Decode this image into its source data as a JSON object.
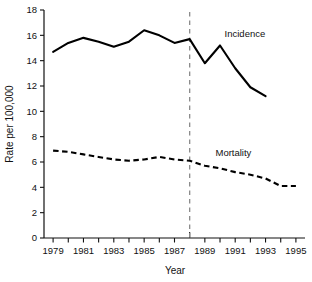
{
  "chart_data": {
    "type": "line",
    "title": "",
    "xlabel": "Year",
    "ylabel": "Rate per 100,000",
    "xlim": [
      1978.4,
      1995.6
    ],
    "ylim": [
      0,
      18
    ],
    "yticks": [
      0,
      2,
      4,
      6,
      8,
      10,
      12,
      14,
      16,
      18
    ],
    "ytick_labels": [
      "0",
      "2",
      "4",
      "6",
      "8",
      "10",
      "12",
      "14",
      "16",
      "18"
    ],
    "xticks": [
      1979,
      1980,
      1981,
      1982,
      1983,
      1984,
      1985,
      1986,
      1987,
      1988,
      1989,
      1990,
      1991,
      1992,
      1993,
      1994,
      1995
    ],
    "xtick_labels": [
      "1979",
      "1981",
      "1983",
      "1985",
      "1987",
      "1989",
      "1991",
      "1993",
      "1995"
    ],
    "xtick_labeled_years": [
      1979,
      1981,
      1983,
      1985,
      1987,
      1989,
      1991,
      1993,
      1995
    ],
    "grid": false,
    "legend_position": "inline-annotation",
    "annotations": [
      {
        "text": "Incidence",
        "x": 1990.3,
        "y": 15.9
      },
      {
        "text": "Mortality",
        "x": 1989.7,
        "y": 6.5
      }
    ],
    "reference_lines": [
      {
        "orientation": "vertical",
        "x": 1988,
        "style": "dashed",
        "color": "#8a8a8a"
      }
    ],
    "series": [
      {
        "name": "Incidence",
        "style": "solid",
        "color": "#000000",
        "x": [
          1979,
          1980,
          1981,
          1982,
          1983,
          1984,
          1985,
          1986,
          1987,
          1988,
          1989,
          1990,
          1991,
          1992,
          1993
        ],
        "values": [
          14.7,
          15.4,
          15.8,
          15.5,
          15.1,
          15.5,
          16.4,
          16.0,
          15.4,
          15.7,
          13.8,
          15.2,
          13.4,
          11.9,
          11.2
        ]
      },
      {
        "name": "Mortality",
        "style": "dashed",
        "color": "#000000",
        "x": [
          1979,
          1980,
          1981,
          1982,
          1983,
          1984,
          1985,
          1986,
          1987,
          1988,
          1989,
          1990,
          1991,
          1992,
          1993,
          1994,
          1995
        ],
        "values": [
          6.9,
          6.8,
          6.6,
          6.4,
          6.2,
          6.1,
          6.2,
          6.4,
          6.2,
          6.1,
          5.7,
          5.5,
          5.2,
          5.0,
          4.7,
          4.1,
          4.1
        ]
      }
    ]
  }
}
